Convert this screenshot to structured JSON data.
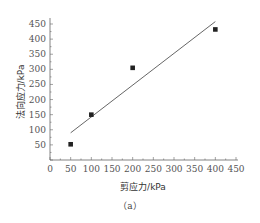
{
  "chart_data": {
    "type": "scatter",
    "title": "",
    "caption": "（a）",
    "xlabel": "剪应力/kPa",
    "ylabel": "法向应力/kPa",
    "xlim": [
      0,
      450
    ],
    "ylim": [
      0,
      470
    ],
    "x_ticks": [
      0,
      50,
      100,
      150,
      200,
      250,
      300,
      350,
      400,
      450
    ],
    "y_ticks": [
      50,
      100,
      150,
      200,
      250,
      300,
      350,
      400,
      450
    ],
    "grid": false,
    "legend": null,
    "series": [
      {
        "name": "measured",
        "type": "scatter",
        "marker": "square",
        "color": "#222222",
        "x": [
          50,
          100,
          200,
          400
        ],
        "y": [
          52,
          150,
          305,
          432
        ]
      },
      {
        "name": "linear fit",
        "type": "line",
        "color": "#555555",
        "x": [
          50,
          400
        ],
        "y": [
          90,
          458
        ]
      }
    ]
  }
}
